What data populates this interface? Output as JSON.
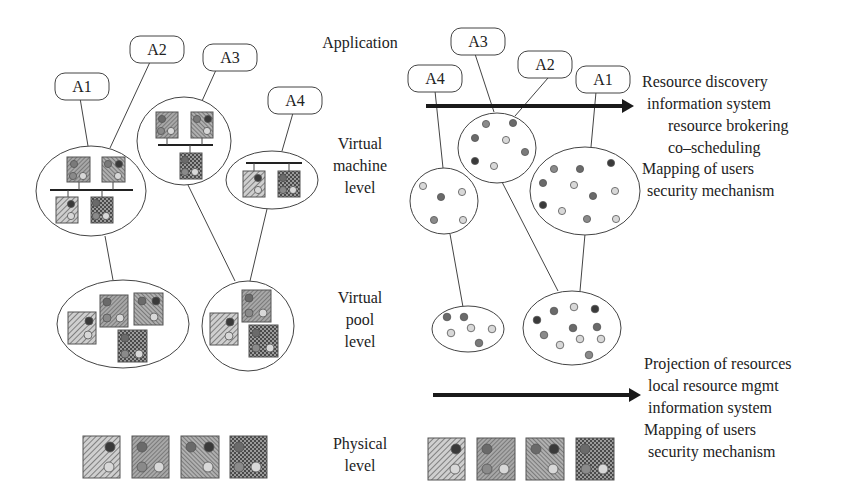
{
  "levels": {
    "application": "Application",
    "virtual_machine": [
      "Virtual",
      "machine",
      "level"
    ],
    "virtual_pool": [
      "Virtual",
      "pool",
      "level"
    ],
    "physical": [
      "Physical",
      "level"
    ]
  },
  "left_apps": [
    "A1",
    "A2",
    "A3",
    "A4"
  ],
  "right_apps": [
    "A4",
    "A3",
    "A2",
    "A1"
  ],
  "upper_services": [
    "Resource discovery",
    "information system",
    "resource brokering",
    "co–scheduling",
    "Mapping of users",
    "security mechanism"
  ],
  "lower_services": [
    "Projection of resources",
    "local resource mgmt",
    "information system",
    "Mapping of users",
    "security mechanism"
  ],
  "colors": {
    "stroke": "#444444",
    "arrow": "#1a1a1a",
    "dot_dark": "#3a3a3a",
    "dot_mid": "#7a7a7a",
    "dot_light": "#d8d8d8"
  }
}
